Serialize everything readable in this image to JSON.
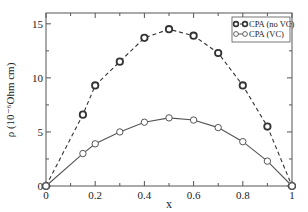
{
  "chart_data": {
    "type": "line",
    "title": "",
    "xlabel": "x",
    "ylabel": "ρ (10⁻⁶Ohm cm)",
    "xlim": [
      0,
      1
    ],
    "ylim": [
      0,
      16
    ],
    "x_ticks": [
      0,
      0.2,
      0.4,
      0.6,
      0.8,
      1
    ],
    "x_tick_labels": [
      "0",
      "0.2",
      "0.4",
      "0.6",
      "0.8",
      "1"
    ],
    "y_ticks": [
      0,
      5,
      10,
      15
    ],
    "y_tick_labels": [
      "0",
      "5",
      "10",
      "15"
    ],
    "grid": false,
    "legend_position": "upper right",
    "series": [
      {
        "name": "CPA (no VC)",
        "line_style": "dashed",
        "marker": "circle-bold",
        "x": [
          0,
          0.15,
          0.2,
          0.3,
          0.4,
          0.5,
          0.6,
          0.7,
          0.8,
          0.9,
          1.0
        ],
        "values": [
          0,
          6.6,
          9.3,
          11.5,
          13.7,
          14.5,
          13.9,
          12.3,
          9.3,
          5.5,
          0
        ]
      },
      {
        "name": "CPA (VC)",
        "line_style": "solid",
        "marker": "circle",
        "x": [
          0,
          0.15,
          0.2,
          0.3,
          0.4,
          0.5,
          0.6,
          0.7,
          0.8,
          0.9,
          1.0
        ],
        "values": [
          0,
          3.0,
          3.9,
          5.0,
          5.9,
          6.3,
          6.1,
          5.4,
          4.1,
          2.3,
          0
        ]
      }
    ]
  },
  "colors": {
    "axis": "#555555",
    "series_no_vc": "#333333",
    "series_vc": "#555555"
  }
}
